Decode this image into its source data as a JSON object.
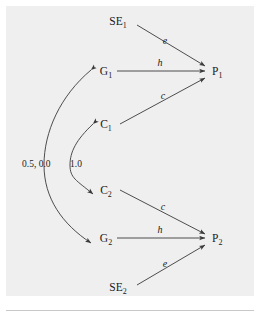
{
  "figure": {
    "type": "path-diagram",
    "background_color": "#efefef",
    "page_color": "#ffffff",
    "ink_color": "#3a3a3a",
    "text_color": "#1b1b1b"
  },
  "nodes": [
    {
      "id": "SE1",
      "base": "SE",
      "sub": "1",
      "x": 118,
      "y": 22
    },
    {
      "id": "G1",
      "base": "G",
      "sub": "1",
      "x": 104,
      "y": 74
    },
    {
      "id": "C1",
      "base": "C",
      "sub": "1",
      "x": 104,
      "y": 127
    },
    {
      "id": "C2",
      "base": "C",
      "sub": "2",
      "x": 104,
      "y": 192
    },
    {
      "id": "G2",
      "base": "G",
      "sub": "2",
      "x": 104,
      "y": 240
    },
    {
      "id": "SE2",
      "base": "SE",
      "sub": "2",
      "x": 118,
      "y": 288
    },
    {
      "id": "P1",
      "base": "P",
      "sub": "1",
      "x": 216,
      "y": 74
    },
    {
      "id": "P2",
      "base": "P",
      "sub": "2",
      "x": 216,
      "y": 240
    }
  ],
  "edges": [
    {
      "id": "se1-p1",
      "from": "SE1",
      "to": "P1",
      "label": "e",
      "label_x": 165,
      "label_y": 44
    },
    {
      "id": "g1-p1",
      "from": "G1",
      "to": "P1",
      "label": "h",
      "label_x": 160,
      "label_y": 68
    },
    {
      "id": "c1-p1",
      "from": "C1",
      "to": "P1",
      "label": "c",
      "label_x": 163,
      "label_y": 101
    },
    {
      "id": "c2-p2",
      "from": "C2",
      "to": "P2",
      "label": "c",
      "label_x": 163,
      "label_y": 212
    },
    {
      "id": "g2-p2",
      "from": "G2",
      "to": "P2",
      "label": "h",
      "label_x": 160,
      "label_y": 234
    },
    {
      "id": "se2-p2",
      "from": "SE2",
      "to": "P2",
      "label": "e",
      "label_x": 165,
      "label_y": 269
    }
  ],
  "correlations": [
    {
      "id": "g-correlation",
      "between": [
        "G1",
        "G2"
      ],
      "label": "0.5, 0.0",
      "label_x": 22,
      "label_y": 164
    },
    {
      "id": "c-correlation",
      "between": [
        "C1",
        "C2"
      ],
      "label": "1.0",
      "label_x": 70,
      "label_y": 164
    }
  ]
}
